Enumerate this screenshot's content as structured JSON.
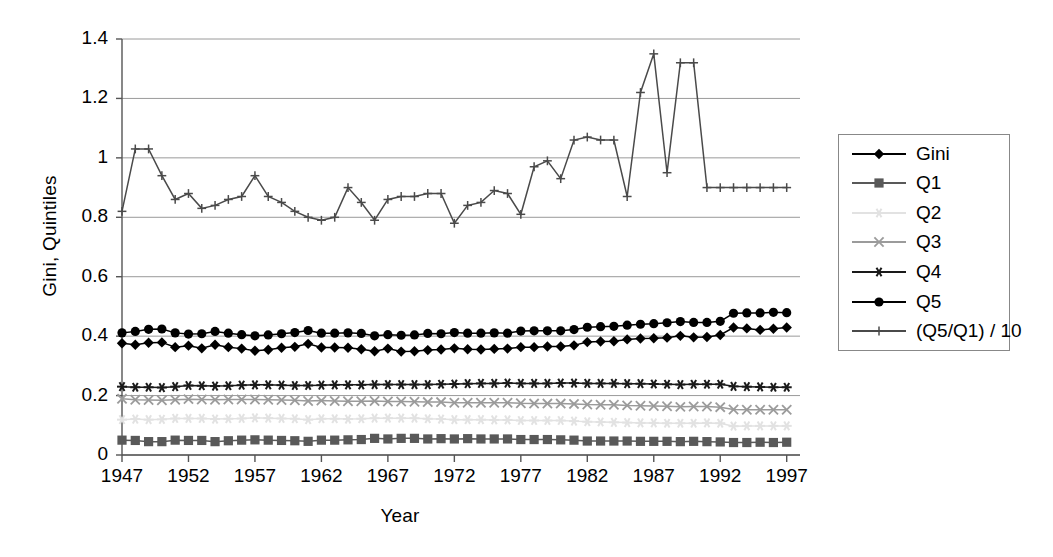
{
  "chart_data": {
    "type": "line",
    "title": "",
    "xlabel": "Year",
    "ylabel": "Gini, Quintiles",
    "xlim": [
      1947,
      1998
    ],
    "ylim": [
      0,
      1.4
    ],
    "ytick_labels": [
      "0",
      "0.2",
      "0.4",
      "0.6",
      "0.8",
      "1",
      "1.2",
      "1.4"
    ],
    "ytick_values": [
      0,
      0.2,
      0.4,
      0.6,
      0.8,
      1.0,
      1.2,
      1.4
    ],
    "xtick_labels": [
      "1947",
      "1952",
      "1957",
      "1962",
      "1967",
      "1972",
      "1977",
      "1982",
      "1987",
      "1992",
      "1997"
    ],
    "xtick_values": [
      1947,
      1952,
      1957,
      1962,
      1967,
      1972,
      1977,
      1982,
      1987,
      1992,
      1997
    ],
    "grid": "horizontal",
    "legend_position": "right",
    "x": [
      1947,
      1948,
      1949,
      1950,
      1951,
      1952,
      1953,
      1954,
      1955,
      1956,
      1957,
      1958,
      1959,
      1960,
      1961,
      1962,
      1963,
      1964,
      1965,
      1966,
      1967,
      1968,
      1969,
      1970,
      1971,
      1972,
      1973,
      1974,
      1975,
      1976,
      1977,
      1978,
      1979,
      1980,
      1981,
      1982,
      1983,
      1984,
      1985,
      1986,
      1987,
      1988,
      1989,
      1990,
      1991,
      1992,
      1993,
      1994,
      1995,
      1996,
      1997
    ],
    "series": [
      {
        "name": "Gini",
        "marker": "diamond",
        "color": "#000000",
        "values": [
          0.376,
          0.371,
          0.378,
          0.379,
          0.363,
          0.368,
          0.359,
          0.371,
          0.363,
          0.358,
          0.351,
          0.354,
          0.361,
          0.364,
          0.374,
          0.362,
          0.362,
          0.361,
          0.356,
          0.349,
          0.358,
          0.348,
          0.349,
          0.353,
          0.355,
          0.359,
          0.356,
          0.355,
          0.357,
          0.358,
          0.363,
          0.363,
          0.365,
          0.365,
          0.369,
          0.38,
          0.382,
          0.383,
          0.389,
          0.392,
          0.393,
          0.395,
          0.401,
          0.396,
          0.397,
          0.404,
          0.429,
          0.426,
          0.421,
          0.425,
          0.429
        ]
      },
      {
        "name": "Q1",
        "marker": "square",
        "color": "#595959",
        "values": [
          0.05,
          0.049,
          0.045,
          0.045,
          0.05,
          0.049,
          0.049,
          0.045,
          0.048,
          0.05,
          0.051,
          0.05,
          0.049,
          0.048,
          0.046,
          0.05,
          0.05,
          0.051,
          0.052,
          0.056,
          0.054,
          0.056,
          0.056,
          0.054,
          0.055,
          0.054,
          0.055,
          0.054,
          0.054,
          0.054,
          0.052,
          0.052,
          0.052,
          0.051,
          0.05,
          0.047,
          0.047,
          0.047,
          0.047,
          0.046,
          0.046,
          0.046,
          0.045,
          0.046,
          0.045,
          0.044,
          0.042,
          0.042,
          0.043,
          0.042,
          0.043
        ]
      },
      {
        "name": "Q2",
        "marker": "star-light",
        "color": "#e2e2e2",
        "values": [
          0.119,
          0.121,
          0.119,
          0.12,
          0.123,
          0.123,
          0.123,
          0.121,
          0.122,
          0.123,
          0.125,
          0.124,
          0.123,
          0.122,
          0.119,
          0.122,
          0.122,
          0.121,
          0.122,
          0.124,
          0.124,
          0.124,
          0.124,
          0.122,
          0.121,
          0.119,
          0.119,
          0.119,
          0.118,
          0.118,
          0.116,
          0.116,
          0.116,
          0.116,
          0.114,
          0.112,
          0.111,
          0.11,
          0.109,
          0.108,
          0.108,
          0.107,
          0.107,
          0.107,
          0.108,
          0.107,
          0.097,
          0.098,
          0.098,
          0.098,
          0.098
        ]
      },
      {
        "name": "Q3",
        "marker": "x-gray",
        "color": "#9b9b9b",
        "values": [
          0.189,
          0.186,
          0.185,
          0.184,
          0.186,
          0.188,
          0.187,
          0.186,
          0.187,
          0.187,
          0.187,
          0.186,
          0.185,
          0.184,
          0.182,
          0.183,
          0.182,
          0.181,
          0.181,
          0.182,
          0.18,
          0.18,
          0.179,
          0.178,
          0.178,
          0.176,
          0.176,
          0.176,
          0.176,
          0.176,
          0.174,
          0.173,
          0.173,
          0.173,
          0.172,
          0.17,
          0.169,
          0.169,
          0.167,
          0.166,
          0.165,
          0.164,
          0.162,
          0.163,
          0.163,
          0.161,
          0.153,
          0.152,
          0.152,
          0.152,
          0.152
        ]
      },
      {
        "name": "Q4",
        "marker": "asterisk",
        "color": "#1a1a1a",
        "values": [
          0.23,
          0.228,
          0.228,
          0.227,
          0.23,
          0.234,
          0.233,
          0.232,
          0.233,
          0.235,
          0.236,
          0.236,
          0.235,
          0.234,
          0.234,
          0.235,
          0.236,
          0.236,
          0.236,
          0.237,
          0.237,
          0.237,
          0.237,
          0.237,
          0.238,
          0.239,
          0.24,
          0.241,
          0.241,
          0.242,
          0.241,
          0.241,
          0.241,
          0.242,
          0.242,
          0.241,
          0.241,
          0.241,
          0.24,
          0.24,
          0.239,
          0.238,
          0.237,
          0.238,
          0.238,
          0.238,
          0.231,
          0.23,
          0.229,
          0.228,
          0.228
        ]
      },
      {
        "name": "Q5",
        "marker": "circle",
        "color": "#000000",
        "values": [
          0.411,
          0.416,
          0.423,
          0.424,
          0.411,
          0.407,
          0.408,
          0.416,
          0.41,
          0.405,
          0.401,
          0.404,
          0.408,
          0.412,
          0.419,
          0.41,
          0.41,
          0.411,
          0.409,
          0.401,
          0.405,
          0.403,
          0.404,
          0.409,
          0.408,
          0.412,
          0.41,
          0.41,
          0.411,
          0.41,
          0.417,
          0.418,
          0.418,
          0.418,
          0.422,
          0.43,
          0.432,
          0.433,
          0.437,
          0.44,
          0.442,
          0.445,
          0.449,
          0.446,
          0.446,
          0.45,
          0.477,
          0.478,
          0.478,
          0.48,
          0.479
        ]
      },
      {
        "name": "(Q5/Q1) / 10",
        "marker": "plus",
        "color": "#4a4a4a",
        "values": [
          0.82,
          1.03,
          1.03,
          0.94,
          0.86,
          0.88,
          0.83,
          0.84,
          0.86,
          0.87,
          0.94,
          0.87,
          0.85,
          0.82,
          0.8,
          0.79,
          0.8,
          0.9,
          0.85,
          0.79,
          0.86,
          0.87,
          0.87,
          0.88,
          0.88,
          0.78,
          0.84,
          0.85,
          0.89,
          0.88,
          0.81,
          0.97,
          0.99,
          0.93,
          1.06,
          1.07,
          1.06,
          1.06,
          0.87,
          1.22,
          1.35,
          0.95,
          1.32,
          1.32,
          0.9,
          0.9,
          0.9,
          0.9,
          0.9,
          0.9,
          0.9
        ]
      }
    ]
  },
  "legend": {
    "items": [
      {
        "label": "Gini",
        "marker": "diamond",
        "color": "#000000"
      },
      {
        "label": "Q1",
        "marker": "square",
        "color": "#595959"
      },
      {
        "label": "Q2",
        "marker": "star-light",
        "color": "#e2e2e2"
      },
      {
        "label": "Q3",
        "marker": "x-gray",
        "color": "#9b9b9b"
      },
      {
        "label": "Q4",
        "marker": "asterisk",
        "color": "#1a1a1a"
      },
      {
        "label": "Q5",
        "marker": "circle",
        "color": "#000000"
      },
      {
        "label": "(Q5/Q1) / 10",
        "marker": "plus",
        "color": "#4a4a4a"
      }
    ]
  },
  "axes": {
    "x_title": "Year",
    "y_title": "Gini, Quintiles"
  },
  "colors": {
    "grid": "#9a9a9a",
    "axis": "#555555",
    "background": "#ffffff"
  }
}
